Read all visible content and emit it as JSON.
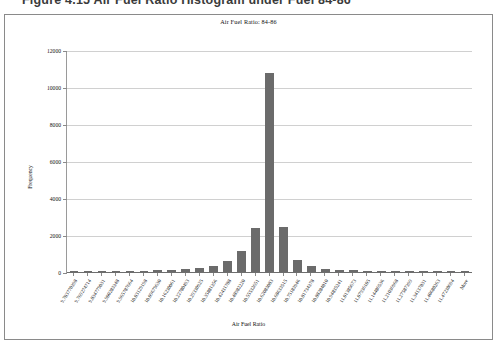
{
  "document": {
    "headline": "Figure 4.15  Air Fuel Ratio Histogram under Fuel 84-86"
  },
  "chart_data": {
    "type": "bar",
    "title": "Air Fuel Ratio: 84-86",
    "xlabel": "Air Fuel Ratio",
    "ylabel": "Frequency",
    "ylim": [
      0,
      12000
    ],
    "ytick_labels": [
      "12000",
      "10000",
      "8000",
      "6000",
      "4000",
      "2000",
      "0"
    ],
    "ytick_values": [
      12000,
      10000,
      8000,
      6000,
      4000,
      2000,
      0
    ],
    "grid": true,
    "legend": "none",
    "bar_color": "#6b6b6b",
    "categories": [
      "9.703770398",
      "9.769274714",
      "9.834779031",
      "9.900283348",
      "9.965787664",
      "10.03129198",
      "10.09679630",
      "10.16230061",
      "10.22780493",
      "10.29330925",
      "10.35881356",
      "10.42431788",
      "10.48982220",
      "10.55532651",
      "10.62083083",
      "10.68633515",
      "10.75183946",
      "10.81734378",
      "10.88284810",
      "10.94835241",
      "11.01385673",
      "11.07936105",
      "11.14486536",
      "11.21036968",
      "11.27587399",
      "11.34137831",
      "11.40688263",
      "11.47238694",
      "More"
    ],
    "values": [
      40,
      55,
      48,
      62,
      58,
      70,
      95,
      120,
      150,
      210,
      330,
      620,
      1150,
      2380,
      10800,
      2420,
      640,
      300,
      180,
      120,
      90,
      70,
      60,
      50,
      45,
      40,
      35,
      30,
      25
    ]
  }
}
